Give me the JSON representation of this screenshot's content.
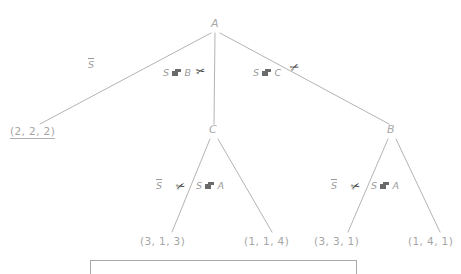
{
  "diagram": {
    "type": "tree",
    "colors": {
      "edge": "#b4b4b4",
      "text": "#a3a3a3",
      "scissors": "#2b2b2b",
      "background": "#ffffff",
      "box_border": "#a9a9a9"
    },
    "nodes": [
      {
        "id": "root",
        "label": "A",
        "x": 215,
        "y": 26
      },
      {
        "id": "midC",
        "label": "C",
        "x": 213,
        "y": 131
      },
      {
        "id": "rightB",
        "label": "B",
        "x": 391,
        "y": 131
      }
    ],
    "leaves": [
      {
        "id": "leaf-222",
        "label": "(2, 2, 2)",
        "x": 38,
        "y": 133,
        "underlined": true
      },
      {
        "id": "leaf-313",
        "label": "(3, 1, 3)",
        "x": 167,
        "y": 242,
        "underlined": false
      },
      {
        "id": "leaf-114",
        "label": "(1, 1, 4)",
        "x": 271,
        "y": 242,
        "underlined": false
      },
      {
        "id": "leaf-331",
        "label": "(3, 3, 1)",
        "x": 341,
        "y": 242,
        "underlined": false
      },
      {
        "id": "leaf-141",
        "label": "(1, 4, 1)",
        "x": 434,
        "y": 242,
        "underlined": false
      }
    ],
    "edges": [
      {
        "id": "edge-a-222",
        "from": "A",
        "to": "(2, 2, 2)",
        "x1": 211,
        "y1": 33,
        "x2": 40,
        "y2": 124,
        "pruned": false
      },
      {
        "id": "edge-a-c",
        "from": "A",
        "to": "C",
        "x1": 215,
        "y1": 33,
        "x2": 214,
        "y2": 124,
        "pruned": true
      },
      {
        "id": "edge-a-b",
        "from": "A",
        "to": "B",
        "x1": 220,
        "y1": 33,
        "x2": 389,
        "y2": 124,
        "pruned": true
      },
      {
        "id": "edge-c-313",
        "from": "C",
        "to": "(3, 1, 3)",
        "x1": 210,
        "y1": 139,
        "x2": 172,
        "y2": 232,
        "pruned": true
      },
      {
        "id": "edge-c-114",
        "from": "C",
        "to": "(1, 1, 4)",
        "x1": 218,
        "y1": 139,
        "x2": 272,
        "y2": 232,
        "pruned": false
      },
      {
        "id": "edge-b-331",
        "from": "B",
        "to": "(3, 3, 1)",
        "x1": 388,
        "y1": 139,
        "x2": 348,
        "y2": 232,
        "pruned": true
      },
      {
        "id": "edge-b-141",
        "from": "B",
        "to": "(1, 4, 1)",
        "x1": 396,
        "y1": 139,
        "x2": 440,
        "y2": 232,
        "pruned": false
      }
    ],
    "edge_labels": [
      {
        "id": "lbl-a-222",
        "prefix": "",
        "over": "S",
        "arrow": false,
        "target": "",
        "x": 88,
        "y": 65,
        "overline": true
      },
      {
        "id": "lbl-a-c",
        "prefix": "S",
        "over": "",
        "arrow": true,
        "target": "B",
        "x": 166,
        "y": 73,
        "overline": false
      },
      {
        "id": "lbl-a-b",
        "prefix": "S",
        "over": "",
        "arrow": true,
        "target": "C",
        "x": 255,
        "y": 73,
        "overline": false
      },
      {
        "id": "lbl-c-313",
        "prefix": "",
        "over": "S",
        "arrow": false,
        "target": "",
        "x": 156,
        "y": 186,
        "overline": true
      },
      {
        "id": "lbl-c-114",
        "prefix": "S",
        "over": "",
        "arrow": true,
        "target": "A",
        "x": 199,
        "y": 186,
        "overline": false
      },
      {
        "id": "lbl-b-331",
        "prefix": "",
        "over": "S",
        "arrow": false,
        "target": "",
        "x": 331,
        "y": 186,
        "overline": true
      },
      {
        "id": "lbl-b-141",
        "prefix": "S",
        "over": "",
        "arrow": true,
        "target": "A",
        "x": 374,
        "y": 186,
        "overline": false
      }
    ],
    "prune_marks": [
      {
        "id": "prune-a-c",
        "glyph": "✂",
        "x": 198,
        "y": 70
      },
      {
        "id": "prune-a-b",
        "glyph": "✂",
        "x": 292,
        "y": 66
      },
      {
        "id": "prune-c-313",
        "glyph": "✂",
        "x": 178,
        "y": 185
      },
      {
        "id": "prune-b-331",
        "glyph": "✂",
        "x": 353,
        "y": 185
      }
    ],
    "bottom_box": {
      "id": "bottom-panel",
      "x": 90,
      "y": 260,
      "width": 265,
      "height": 13
    }
  }
}
